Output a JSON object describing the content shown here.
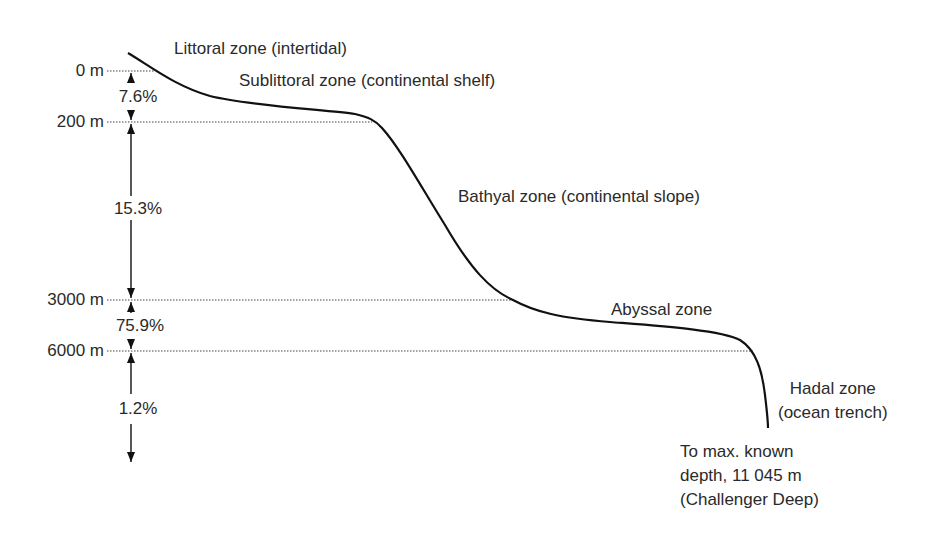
{
  "diagram": {
    "type": "ocean-depth-zones-profile",
    "depth_levels": [
      {
        "label": "0 m",
        "y": 71
      },
      {
        "label": "200 m",
        "y": 122
      },
      {
        "label": "3000 m",
        "y": 300
      },
      {
        "label": "6000 m",
        "y": 351
      }
    ],
    "percentages": [
      {
        "label": "7.6%",
        "between": "0 m – 200 m"
      },
      {
        "label": "15.3%",
        "between": "200 m – 3000 m"
      },
      {
        "label": "75.9%",
        "between": "3000 m – 6000 m"
      },
      {
        "label": "1.2%",
        "between": "below 6000 m"
      }
    ],
    "zones": [
      {
        "label": "Littoral zone (intertidal)"
      },
      {
        "label": "Sublittoral zone (continental shelf)"
      },
      {
        "label": "Bathyal zone (continental slope)"
      },
      {
        "label": "Abyssal zone"
      },
      {
        "label": "Hadal zone\n(ocean trench)"
      }
    ],
    "max_depth_note": "To max. known\ndepth, 11 045 m\n(Challenger Deep)",
    "colors": {
      "line": "#111111",
      "text": "#2a2a2a",
      "dotted": "#444444"
    }
  }
}
